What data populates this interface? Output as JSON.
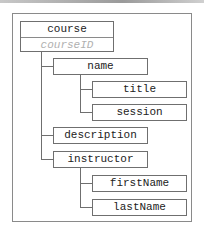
{
  "diagram": {
    "type": "tree",
    "root": {
      "label": "course",
      "key": "courseID",
      "children": [
        {
          "label": "name",
          "children": [
            {
              "label": "title"
            },
            {
              "label": "session"
            }
          ]
        },
        {
          "label": "description"
        },
        {
          "label": "instructor",
          "children": [
            {
              "label": "firstName"
            },
            {
              "label": "lastName"
            }
          ]
        }
      ]
    },
    "nodes": {
      "course": "course",
      "courseID": "courseID",
      "name": "name",
      "title": "title",
      "session": "session",
      "description": "description",
      "instructor": "instructor",
      "firstName": "firstName",
      "lastName": "lastName"
    },
    "colors": {
      "border": "#6f6f6f",
      "key_text": "#b0b0b0",
      "text": "#222222"
    }
  }
}
